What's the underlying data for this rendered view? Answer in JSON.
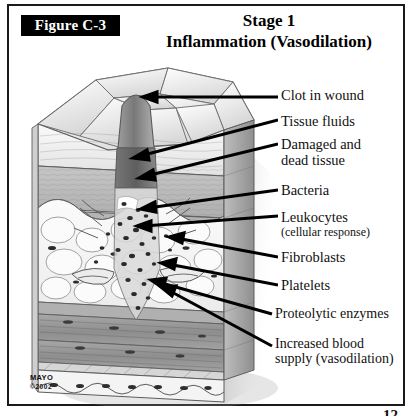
{
  "figure": {
    "badge": "Figure C-3",
    "title_line1": "Stage 1",
    "title_line2": "Inflammation (Vasodilation)"
  },
  "credit": {
    "org": "MAYO",
    "copyright": "©2002"
  },
  "page_number": "12",
  "labels": [
    {
      "id": "clot",
      "text": "Clot in wound",
      "sub": ""
    },
    {
      "id": "fluids",
      "text": "Tissue fluids",
      "sub": ""
    },
    {
      "id": "damaged",
      "text": "Damaged and",
      "sub": "dead tissue"
    },
    {
      "id": "bacteria",
      "text": "Bacteria",
      "sub": ""
    },
    {
      "id": "leukocytes",
      "text": "Leukocytes",
      "sub": "(cellular response)"
    },
    {
      "id": "fibroblasts",
      "text": "Fibroblasts",
      "sub": ""
    },
    {
      "id": "platelets",
      "text": "Platelets",
      "sub": ""
    },
    {
      "id": "proteolytic",
      "text": "Proteolytic enzymes",
      "sub": ""
    },
    {
      "id": "increased",
      "text": "Increased blood",
      "sub": "supply (vasodilation)"
    }
  ],
  "illustration": {
    "name": "skin-cross-section-wound-block",
    "layers": [
      "surface-epithelial-cells",
      "epidermis",
      "dermis",
      "subcutaneous-fat",
      "muscle",
      "deep-tissue"
    ]
  },
  "colors": {
    "ink": "#111111",
    "badge_bg": "#000000",
    "badge_fg": "#ffffff",
    "clot_dark": "#6e6e6e",
    "clot_mid": "#8d8d8d",
    "dermis": "#b9b9b9",
    "fat": "#f2f2f2",
    "muscle": "#9a9a9a",
    "outline": "#4a4a4a"
  }
}
